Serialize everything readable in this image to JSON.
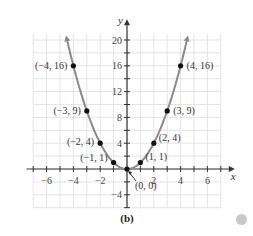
{
  "chart_data": {
    "type": "line",
    "title": "",
    "caption": "(b)",
    "xlabel": "x",
    "ylabel": "y",
    "function": "y = x^2",
    "xlim": [
      -8,
      8
    ],
    "ylim": [
      -6,
      22
    ],
    "grid": true,
    "x_ticks": [
      -6,
      -4,
      -2,
      2,
      4,
      6
    ],
    "y_ticks": [
      -4,
      4,
      8,
      12,
      16,
      20
    ],
    "series": [
      {
        "name": "y = x^2",
        "color": "#8a8a8a",
        "points": [
          {
            "x": -4,
            "y": 16,
            "label": "(−4, 16)"
          },
          {
            "x": -3,
            "y": 9,
            "label": "(−3, 9)"
          },
          {
            "x": -2,
            "y": 4,
            "label": "(−2, 4)"
          },
          {
            "x": -1,
            "y": 1,
            "label": "(−1, 1)"
          },
          {
            "x": 0,
            "y": 0,
            "label": "(0, 0)"
          },
          {
            "x": 1,
            "y": 1,
            "label": "(1, 1)"
          },
          {
            "x": 2,
            "y": 4,
            "label": "(2, 4)"
          },
          {
            "x": 3,
            "y": 9,
            "label": "(3, 9)"
          },
          {
            "x": 4,
            "y": 16,
            "label": "(4, 16)"
          }
        ]
      }
    ]
  },
  "colors": {
    "curve": "#8a8a8a",
    "grid": "#e4e4e4",
    "axis": "#333333",
    "point": "#111111"
  }
}
